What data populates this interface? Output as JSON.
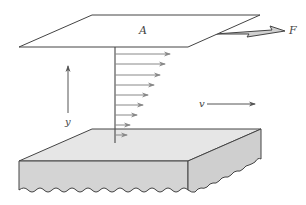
{
  "diagram": {
    "labels": {
      "area": "A",
      "force": "F",
      "velocity": "v",
      "height": "y"
    },
    "colors": {
      "line": "#444444",
      "arrow": "#888888",
      "force_fill": "#d0d0d0",
      "base_top": "#e6e6e6",
      "base_front": "#d4d4d4",
      "base_side": "#cfcfcf",
      "plate_fill": "#ffffff"
    },
    "velocity_profile": [
      {
        "y": 54,
        "x_end": 170
      },
      {
        "y": 64,
        "x_end": 165
      },
      {
        "y": 75,
        "x_end": 160
      },
      {
        "y": 85,
        "x_end": 154
      },
      {
        "y": 95,
        "x_end": 148
      },
      {
        "y": 105,
        "x_end": 143
      },
      {
        "y": 115,
        "x_end": 137
      },
      {
        "y": 125,
        "x_end": 130
      },
      {
        "y": 135,
        "x_end": 127
      }
    ]
  }
}
